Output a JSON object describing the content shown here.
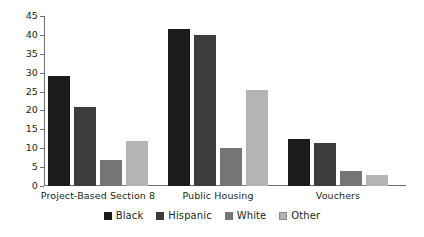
{
  "chart_data": {
    "type": "bar",
    "title": "",
    "subtitle": "",
    "xlabel": "",
    "ylabel": "",
    "ylim": [
      0,
      45
    ],
    "y_ticks": [
      0,
      5,
      10,
      15,
      20,
      25,
      30,
      35,
      40,
      45
    ],
    "grid": false,
    "legend_position": "bottom",
    "categories": [
      "Project-Based Section 8",
      "Public Housing",
      "Vouchers"
    ],
    "series": [
      {
        "name": "Black",
        "color": "#1b1b1b",
        "values": [
          29,
          41.5,
          12.5
        ]
      },
      {
        "name": "Hispanic",
        "color": "#3d3d3d",
        "values": [
          21,
          40,
          11.5
        ]
      },
      {
        "name": "White",
        "color": "#757575",
        "values": [
          7,
          10,
          4
        ]
      },
      {
        "name": "Other",
        "color": "#b4b4b4",
        "values": [
          12,
          25.5,
          3
        ]
      }
    ]
  },
  "axis": {
    "tick_labels": [
      "45",
      "40",
      "35",
      "30",
      "25",
      "20",
      "15",
      "10",
      "5",
      "0"
    ]
  },
  "legend": {
    "items": [
      {
        "label": "Black",
        "swatch": "#1b1b1b"
      },
      {
        "label": "Hispanic",
        "swatch": "#3d3d3d"
      },
      {
        "label": "White",
        "swatch": "#757575"
      },
      {
        "label": "Other",
        "swatch": "#b4b4b4"
      }
    ]
  },
  "groups": [
    {
      "label": "Project-Based Section 8"
    },
    {
      "label": "Public Housing"
    },
    {
      "label": "Vouchers"
    }
  ]
}
